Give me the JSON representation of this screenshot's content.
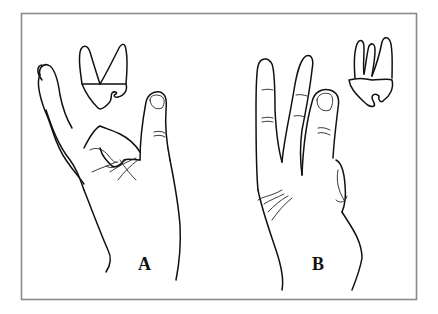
{
  "figure": {
    "panels": [
      {
        "label": "A",
        "subject": "hand with thumb and fingers, two-rooted tooth above"
      },
      {
        "label": "B",
        "subject": "hand with index and middle fingers raised, three-rooted tooth beside"
      }
    ]
  }
}
